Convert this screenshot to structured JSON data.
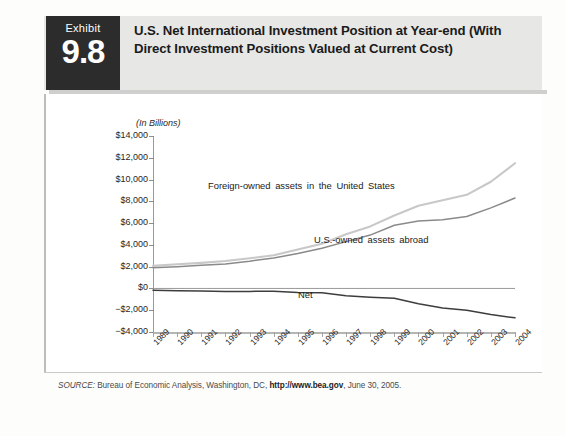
{
  "exhibit": {
    "word": "Exhibit",
    "number": "9.8",
    "title": "U.S. Net International Investment Position at Year-end (With Direct Investment Positions Valued at Current Cost)"
  },
  "source": {
    "label": "SOURCE:",
    "body_before": " Bureau of Economic Analysis, Washington, DC, ",
    "url": "http://www.bea.gov",
    "body_after": ", June 30, 2005."
  },
  "colors": {
    "header_band": "#e7e7e5",
    "exhibit_block": "#2c2c2c",
    "foreign_owned_line": "#c8c8c8",
    "us_owned_line": "#8a8a8a",
    "net_line": "#3d3d3d",
    "zero_line": "#9a9a98",
    "axis": "#9a9a98"
  },
  "chart_data": {
    "type": "line",
    "title": "U.S. Net International Investment Position at Year-end",
    "xlabel": "",
    "ylabel": "(In Billions)",
    "axis_note": "(In Billions)",
    "ylim": [
      -4000,
      14000
    ],
    "ytick_values": [
      14000,
      12000,
      10000,
      8000,
      6000,
      4000,
      2000,
      0,
      -2000,
      -4000
    ],
    "ytick_labels": [
      "$14,000",
      "$12,000",
      "$10,000",
      "$8,000",
      "$6,000",
      "$4,000",
      "$2,000",
      "$0",
      "−$2,000",
      "−$4,000"
    ],
    "grid": false,
    "legend_position": "inline-annotations",
    "categories": [
      1989,
      1990,
      1991,
      1992,
      1993,
      1994,
      1995,
      1996,
      1997,
      1998,
      1999,
      2000,
      2001,
      2002,
      2003,
      2004
    ],
    "xtick_labels": [
      "1989",
      "1990",
      "1991",
      "1992",
      "1993",
      "1994",
      "1995",
      "1996",
      "1997",
      "1998",
      "1999",
      "2000",
      "2001",
      "2002",
      "2003",
      "2004"
    ],
    "series": [
      {
        "name": "Foreign-owned assets in the United States",
        "color": "#c8c8c8",
        "values": [
          2075,
          2220,
          2350,
          2520,
          2770,
          3050,
          3570,
          4100,
          4980,
          5700,
          6700,
          7600,
          8100,
          8600,
          9800,
          11500
        ]
      },
      {
        "name": "U.S.-owned assets abroad",
        "color": "#8a8a8a",
        "values": [
          1900,
          2000,
          2120,
          2250,
          2500,
          2800,
          3200,
          3700,
          4300,
          4900,
          5800,
          6200,
          6300,
          6600,
          7400,
          8300
        ]
      },
      {
        "name": "Net",
        "color": "#3d3d3d",
        "values": [
          -175,
          -220,
          -230,
          -270,
          -270,
          -250,
          -370,
          -400,
          -680,
          -800,
          -900,
          -1400,
          -1800,
          -2000,
          -2400,
          -2700
        ]
      }
    ],
    "annotations": [
      {
        "text": "Foreign-owned assets in the United States",
        "series": "Foreign-owned assets in the United States"
      },
      {
        "text": "U.S.-owned assets abroad",
        "series": "U.S.-owned assets abroad"
      },
      {
        "text": "Net",
        "series": "Net"
      }
    ]
  }
}
